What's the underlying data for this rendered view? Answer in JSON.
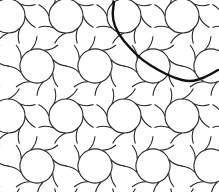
{
  "image": {
    "title": "Curved interlaced geometric tiling pattern",
    "width": 219,
    "height": 192,
    "background": "#ffffff",
    "stroke_color": "#2a2a2a",
    "stroke_width": 1.1,
    "highlight_color": "#111111",
    "highlight_width": 2.4
  },
  "pattern": {
    "cell_w": 58,
    "cell_h": 50,
    "offset_x": -6,
    "offset_y": -4,
    "rosette_radius": 17,
    "petals": 8
  },
  "highlight_curve": {
    "points": [
      [
        114,
        2
      ],
      [
        112,
        18
      ],
      [
        118,
        34
      ],
      [
        130,
        48
      ],
      [
        142,
        60
      ],
      [
        158,
        70
      ],
      [
        174,
        78
      ],
      [
        190,
        82
      ],
      [
        204,
        78
      ],
      [
        218,
        70
      ]
    ]
  }
}
